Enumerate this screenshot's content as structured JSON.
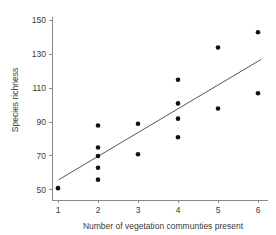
{
  "chart_data": {
    "type": "scatter",
    "title": "",
    "xlabel": "Number of vegetation communties present",
    "ylabel": "Species richness",
    "xlim": [
      0.85,
      6.25
    ],
    "ylim": [
      44,
      152
    ],
    "xticks": [
      1,
      2,
      3,
      4,
      5,
      6
    ],
    "xtick_labels": [
      "1",
      "2",
      "3",
      "4",
      "5",
      "6"
    ],
    "yticks": [
      50,
      70,
      90,
      110,
      130,
      150
    ],
    "ytick_labels": [
      "50",
      "70",
      "90",
      "110",
      "130",
      "150"
    ],
    "grid": false,
    "legend": null,
    "marker": {
      "shape": "circle",
      "color": "#111111",
      "size_px": 4.6
    },
    "points": [
      {
        "x": 1,
        "y": 51
      },
      {
        "x": 2,
        "y": 88
      },
      {
        "x": 2,
        "y": 75
      },
      {
        "x": 2,
        "y": 70
      },
      {
        "x": 2,
        "y": 63
      },
      {
        "x": 2,
        "y": 56
      },
      {
        "x": 3,
        "y": 89
      },
      {
        "x": 3,
        "y": 71
      },
      {
        "x": 4,
        "y": 115
      },
      {
        "x": 4,
        "y": 101
      },
      {
        "x": 4,
        "y": 92
      },
      {
        "x": 4,
        "y": 81
      },
      {
        "x": 5,
        "y": 134
      },
      {
        "x": 5,
        "y": 98
      },
      {
        "x": 6,
        "y": 143
      },
      {
        "x": 6,
        "y": 107
      }
    ],
    "trendline": {
      "type": "linear-fit",
      "color": "#555555",
      "x_start": 1.02,
      "y_start": 56,
      "x_end": 6.08,
      "y_end": 127
    }
  }
}
